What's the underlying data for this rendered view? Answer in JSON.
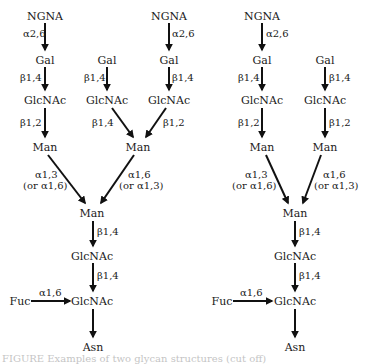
{
  "figure": {
    "caption_partial": "FIGURE  Examples of two glycan structures (cut off)",
    "diagrams": [
      {
        "id": "left",
        "nodes": {
          "ngna_a": "NGNA",
          "gal_a": "Gal",
          "glcnac_a": "GlcNAc",
          "man_a": "Man",
          "gal_b": "Gal",
          "glcnac_b": "GlcNAc",
          "ngna_c": "NGNA",
          "gal_c": "Gal",
          "glcnac_c": "GlcNAc",
          "man_bc": "Man",
          "man_core": "Man",
          "glcnac_core1": "GlcNAc",
          "glcnac_core2": "GlcNAc",
          "fuc": "Fuc",
          "asn": "Asn"
        },
        "edges": {
          "ngna_a_gal_a": "α2,6",
          "gal_a_glcnac_a": "β1,4",
          "glcnac_a_man_a": "β1,2",
          "gal_b_glcnac_b": "β1,4",
          "glcnac_b_man_bc": "β1,4",
          "ngna_c_gal_c": "α2,6",
          "gal_c_glcnac_c": "β1,4",
          "glcnac_c_man_bc": "β1,2",
          "man_a_core": "α1,3",
          "man_a_core_alt": "(or α1,6)",
          "man_bc_core": "α1,6",
          "man_bc_core_alt": "(or α1,3)",
          "core_man_glcnac": "β1,4",
          "core_glcnac_glcnac": "β1,4",
          "fuc_glcnac": "α1,6"
        }
      },
      {
        "id": "right",
        "nodes": {
          "ngna_a": "NGNA",
          "gal_a": "Gal",
          "glcnac_a": "GlcNAc",
          "man_a": "Man",
          "gal_b": "Gal",
          "glcnac_b": "GlcNAc",
          "man_b": "Man",
          "man_core": "Man",
          "glcnac_core1": "GlcNAc",
          "glcnac_core2": "GlcNAc",
          "fuc": "Fuc",
          "asn": "Asn"
        },
        "edges": {
          "ngna_a_gal_a": "α2,6",
          "gal_a_glcnac_a": "β1,4",
          "glcnac_a_man_a": "β1,2",
          "gal_b_glcnac_b": "β1,4",
          "glcnac_b_man_b": "β1,2",
          "man_a_core": "α1,3",
          "man_a_core_alt": "(or α1,6)",
          "man_b_core": "α1,6",
          "man_b_core_alt": "(or α1,3)",
          "core_man_glcnac": "β1,4",
          "core_glcnac_glcnac": "β1,4",
          "fuc_glcnac": "α1,6"
        }
      }
    ]
  }
}
